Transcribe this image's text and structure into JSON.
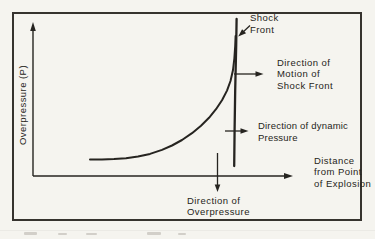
{
  "colors": {
    "paper": "#f5f4ef",
    "ink": "#262420",
    "frame": "#36332e"
  },
  "y_axis": {
    "label": "Overpressure (P)"
  },
  "x_axis": {
    "label_lines": [
      "Distance",
      "from Point",
      "of Explosion"
    ]
  },
  "annotations": {
    "shock_front": {
      "lines": [
        "Shock",
        "Front"
      ]
    },
    "motion": {
      "lines": [
        "Direction of",
        "Motion of",
        "Shock Front"
      ]
    },
    "dynamic": {
      "lines": [
        "Direction of dynamic",
        "Pressure"
      ]
    },
    "overpressure": {
      "lines": [
        "Direction of",
        "Overpressure"
      ]
    }
  },
  "chart_data": {
    "type": "line",
    "title": "",
    "xlabel": "Distance from Point of Explosion",
    "ylabel": "Overpressure (P)",
    "grid": false,
    "qualitative": true,
    "series_note": "Overpressure rises slowly with distance then climbs steeply to a near-vertical shock front; no numeric scale shown",
    "curves": {
      "overpressure_curve": [
        [
          90,
          159.6
        ],
        [
          102,
          159.4
        ],
        [
          114,
          159.0
        ],
        [
          126,
          158.2
        ],
        [
          138,
          156.6
        ],
        [
          150,
          153.9
        ],
        [
          162,
          149.9
        ],
        [
          172,
          145.5
        ],
        [
          182,
          140.0
        ],
        [
          192,
          133.2
        ],
        [
          201,
          125.8
        ],
        [
          209,
          117.8
        ],
        [
          216,
          109.2
        ],
        [
          222,
          100.2
        ],
        [
          227,
          90.6
        ],
        [
          230.5,
          81.0
        ],
        [
          233,
          70.0
        ],
        [
          234.4,
          58.0
        ],
        [
          235.2,
          46.0
        ],
        [
          235.6,
          36.0
        ]
      ],
      "shock_front_line": [
        [
          236.6,
          19
        ],
        [
          236.2,
          45
        ],
        [
          235.2,
          90
        ],
        [
          234.6,
          130
        ],
        [
          234.2,
          166
        ]
      ]
    }
  }
}
